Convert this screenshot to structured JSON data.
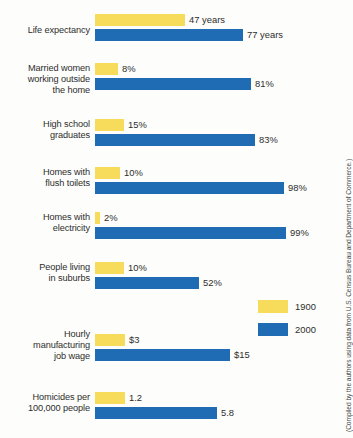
{
  "chart_data": {
    "type": "bar",
    "title": "",
    "xlabel": "",
    "ylabel": "",
    "orientation": "horizontal",
    "grid": false,
    "legend_position": "right-middle",
    "categories": [
      "Life expectancy",
      "Married women working outside the home",
      "High school graduates",
      "Homes with flush toilets",
      "Homes with electricity",
      "People living in suburbs",
      "Hourly manufacturing job wage",
      "Homicides per 100,000 people"
    ],
    "series": [
      {
        "name": "1900",
        "color": "#f7dc5c",
        "values": [
          47,
          8,
          15,
          10,
          2,
          10,
          3,
          1.2
        ],
        "labels": [
          "47 years",
          "8%",
          "15%",
          "10%",
          "2%",
          "10%",
          "$3",
          "1.2"
        ]
      },
      {
        "name": "2000",
        "color": "#1f6cb5",
        "values": [
          77,
          81,
          83,
          98,
          99,
          52,
          15,
          5.8
        ],
        "labels": [
          "77 years",
          "81%",
          "83%",
          "98%",
          "99%",
          "52%",
          "$15",
          "5.8"
        ]
      }
    ]
  },
  "rows": [
    {
      "label_lines": [
        "Life expectancy"
      ],
      "label_text": "Life expectancy",
      "top": 14,
      "label_top": 25,
      "old": {
        "value": 47,
        "label": "47 years",
        "width": 90
      },
      "new": {
        "value": 77,
        "label": "77 years",
        "width": 148
      }
    },
    {
      "label_lines": [
        "Married women",
        "working outside",
        "the home"
      ],
      "label_text": "Married women working outside the home",
      "top": 63,
      "label_top": 63,
      "old": {
        "value": 8,
        "label": "8%",
        "width": 23
      },
      "new": {
        "value": 81,
        "label": "81%",
        "width": 156
      }
    },
    {
      "label_lines": [
        "High school",
        "graduates"
      ],
      "label_text": "High school graduates",
      "top": 119,
      "label_top": 119,
      "old": {
        "value": 15,
        "label": "15%",
        "width": 29
      },
      "new": {
        "value": 83,
        "label": "83%",
        "width": 160
      }
    },
    {
      "label_lines": [
        "Homes with",
        "flush toilets"
      ],
      "label_text": "Homes with flush toilets",
      "top": 167,
      "label_top": 167,
      "old": {
        "value": 10,
        "label": "10%",
        "width": 25
      },
      "new": {
        "value": 98,
        "label": "98%",
        "width": 189
      }
    },
    {
      "label_lines": [
        "Homes with",
        "electricity"
      ],
      "label_text": "Homes with electricity",
      "top": 212,
      "label_top": 212,
      "old": {
        "value": 2,
        "label": "2%",
        "width": 5
      },
      "new": {
        "value": 99,
        "label": "99%",
        "width": 191
      }
    },
    {
      "label_lines": [
        "People living",
        "in suburbs"
      ],
      "label_text": "People living in suburbs",
      "top": 262,
      "label_top": 262,
      "old": {
        "value": 10,
        "label": "10%",
        "width": 29
      },
      "new": {
        "value": 52,
        "label": "52%",
        "width": 104
      }
    },
    {
      "label_lines": [
        "Hourly",
        "manufacturing",
        "job wage"
      ],
      "label_text": "Hourly manufacturing job wage",
      "top": 334,
      "label_top": 329,
      "old": {
        "value": 3,
        "label": "$3",
        "width": 30
      },
      "new": {
        "value": 15,
        "label": "$15",
        "width": 135
      }
    },
    {
      "label_lines": [
        "Homicides per",
        "100,000 people"
      ],
      "label_text": "Homicides per 100,000 people",
      "top": 392,
      "label_top": 392,
      "old": {
        "value": 1.2,
        "label": "1.2",
        "width": 30
      },
      "new": {
        "value": 5.8,
        "label": "5.8",
        "width": 122
      }
    }
  ],
  "legend": {
    "items": [
      {
        "label": "1900",
        "color": "#f7dc5c"
      },
      {
        "label": "2000",
        "color": "#1f6cb5"
      }
    ]
  },
  "source": {
    "text": "(Compiled by the authors using data from U.S. Census Bureau and Department of Commerce.)"
  },
  "colors": {
    "old_series": "#f7dc5c",
    "new_series": "#1f6cb5",
    "background": "#fdfdfb",
    "text": "#2d2d2d"
  }
}
